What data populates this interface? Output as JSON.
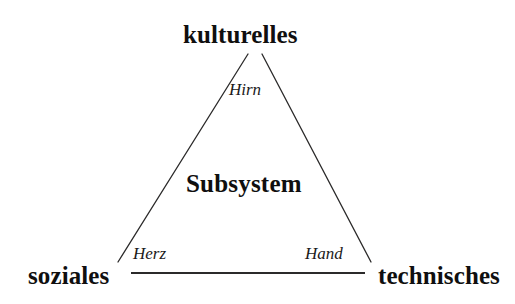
{
  "diagram": {
    "type": "triangle-diagram",
    "background_color": "#ffffff",
    "line_color": "#2b2a2a",
    "text_color": "#100f0f",
    "center_label": "Subsystem",
    "vertices": [
      {
        "id": "top",
        "label": "kulturelles",
        "position": "apex-top"
      },
      {
        "id": "bottom-left",
        "label": "soziales",
        "position": "bottom-left"
      },
      {
        "id": "bottom-right",
        "label": "technisches",
        "position": "bottom-right"
      }
    ],
    "edges": [
      {
        "id": "left-leg",
        "label": "Herz",
        "from": "bottom-left",
        "to": "top",
        "label_position": "lower-left-inside"
      },
      {
        "id": "right-leg",
        "label": "Hand",
        "from": "top",
        "to": "bottom-right",
        "label_position": "lower-right-inside"
      },
      {
        "id": "apex-gap",
        "label": "Hirn",
        "from": "top",
        "to": "top",
        "label_position": "apex-inside"
      },
      {
        "id": "base",
        "label": "",
        "from": "bottom-left",
        "to": "bottom-right",
        "label_position": "none"
      }
    ],
    "geometry": {
      "apex_left_point": {
        "x": 248,
        "y": 54
      },
      "apex_right_point": {
        "x": 262,
        "y": 54
      },
      "left_foot": {
        "x": 118,
        "y": 262
      },
      "right_foot": {
        "x": 371,
        "y": 262
      },
      "base_start": {
        "x": 131,
        "y": 273
      },
      "base_end": {
        "x": 365,
        "y": 273
      },
      "leg_stroke_width": 1.3,
      "base_stroke_width": 2.1
    }
  }
}
